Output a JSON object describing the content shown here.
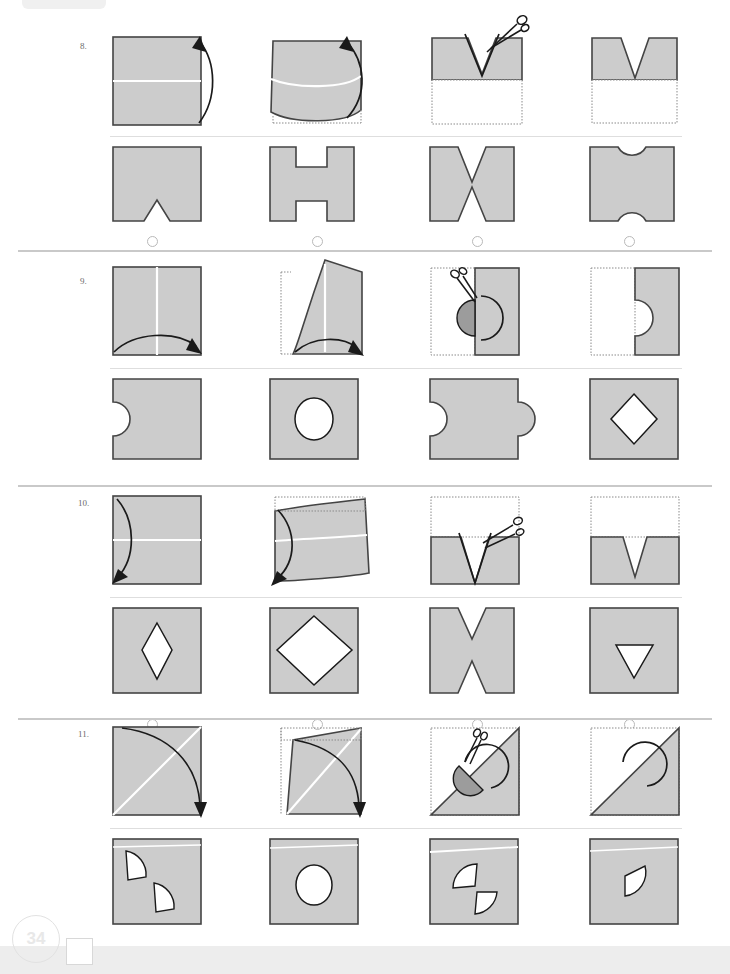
{
  "page": {
    "number": "34",
    "kind": "paper-folding-test",
    "colors": {
      "paper_fill": "#cccccc",
      "paper_stroke": "#444444",
      "dotted_ghost": "#8a8a8a",
      "fold_line": "#ffffff",
      "rule": "#c9c9c9",
      "option_circle": "#b9b9b9",
      "page_number": "#e8e8e8"
    }
  },
  "problems": [
    {
      "number": "8.",
      "fold_axis": "horizontal-up",
      "steps": [
        {
          "name": "unfolded-sheet-with-fold-arrow",
          "label": "square with horizontal fold line, arrow curving up"
        },
        {
          "name": "folding-in-progress",
          "label": "bottom half lifting upward over top half"
        },
        {
          "name": "folded-with-scissors",
          "label": "folded half with V notch being cut by scissors"
        },
        {
          "name": "folded-result",
          "label": "folded half with V notch cut from top edge"
        }
      ],
      "options": [
        {
          "key": "A",
          "label": "square with V notch on bottom edge"
        },
        {
          "key": "B",
          "label": "square with rectangular notches top and bottom"
        },
        {
          "key": "C",
          "label": "square with V notches top and bottom"
        },
        {
          "key": "D",
          "label": "square with semicircular notches top and bottom"
        }
      ]
    },
    {
      "number": "9.",
      "fold_axis": "vertical-right",
      "steps": [
        {
          "name": "unfolded-sheet-with-fold-arrow",
          "label": "square with vertical fold line, arrow curving right"
        },
        {
          "name": "folding-in-progress",
          "label": "left half swinging right over right half"
        },
        {
          "name": "folded-with-scissors",
          "label": "folded half with half-circle being cut by scissors"
        },
        {
          "name": "folded-result",
          "label": "folded half with half-circle removed from fold edge"
        }
      ],
      "options": [
        {
          "key": "A",
          "label": "square with semicircular notch on left edge"
        },
        {
          "key": "B",
          "label": "square with circular hole in centre"
        },
        {
          "key": "C",
          "label": "square with semicircular notches on left and right edges"
        },
        {
          "key": "D",
          "label": "square with diamond hole in centre"
        }
      ]
    },
    {
      "number": "10.",
      "fold_axis": "horizontal-down",
      "steps": [
        {
          "name": "unfolded-sheet-with-fold-arrow",
          "label": "square with horizontal fold line, arrow curving down"
        },
        {
          "name": "folding-in-progress",
          "label": "top half folding down over bottom half"
        },
        {
          "name": "folded-with-scissors",
          "label": "folded half with V notch being cut by scissors"
        },
        {
          "name": "folded-result",
          "label": "folded half with V notch cut from top edge"
        }
      ],
      "options": [
        {
          "key": "A",
          "label": "square with tall narrow diamond hole"
        },
        {
          "key": "B",
          "label": "square with large diamond hole"
        },
        {
          "key": "C",
          "label": "square with V notches top and bottom"
        },
        {
          "key": "D",
          "label": "square with downward triangle hole"
        }
      ]
    },
    {
      "number": "11.",
      "fold_axis": "diagonal",
      "steps": [
        {
          "name": "unfolded-sheet-with-fold-arrow",
          "label": "square with diagonal fold line, arrow curving down-right"
        },
        {
          "name": "folding-in-progress",
          "label": "upper-left triangle folding over diagonal"
        },
        {
          "name": "folded-with-scissors",
          "label": "folded triangle with half-circle being cut by scissors"
        },
        {
          "name": "folded-result",
          "label": "folded triangle with half-circle removed from diagonal edge"
        }
      ],
      "options": [
        {
          "key": "A",
          "label": "square with two quarter-circle holes offset"
        },
        {
          "key": "B",
          "label": "square with circular hole in centre"
        },
        {
          "key": "C",
          "label": "square with two bow-tie half-circle holes"
        },
        {
          "key": "D",
          "label": "square with single half-circle hole"
        }
      ]
    }
  ]
}
